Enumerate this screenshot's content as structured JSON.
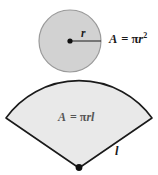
{
  "figure": {
    "labels": {
      "circle_area_A": "A",
      "circle_area_eq": "=",
      "circle_area_pi": "π",
      "circle_area_r": "r",
      "circle_area_exp": "2",
      "radius": "r",
      "sector_area_A": "A",
      "sector_area_eq": "=",
      "sector_area_pi": "π",
      "sector_area_rl": "rl",
      "slant": "l"
    },
    "colors": {
      "circle_fill": "#d2d2d2",
      "circle_stroke": "#9a9a9a",
      "sector_fill": "#e9e9e9",
      "sector_stroke": "#1a1a1a",
      "text": "#1a1a1a",
      "sector_text": "#555555",
      "background": "#ffffff"
    },
    "geometry": {
      "circle_center_x": 70,
      "circle_center_y": 41,
      "circle_radius": 31,
      "sector_apex_x": 79,
      "sector_apex_y": 168,
      "sector_left_corner_x": 6,
      "sector_left_corner_y": 118,
      "sector_right_corner_x": 152,
      "sector_right_corner_y": 118,
      "sector_arc_top_y": 77
    }
  }
}
